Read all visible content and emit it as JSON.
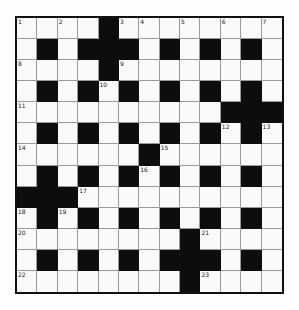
{
  "puzzle": {
    "rows": 13,
    "cols": 13,
    "grid": [
      "....#........",
      ".#.###.#.#.#.",
      "....#........",
      ".#.#.#.#.#.#.",
      "..........###",
      ".#.#.#.#.#.#.",
      "......#......",
      ".#.#.#.#.#.#.",
      "###..........",
      ".#.#.#.#.#.#.",
      "........#....",
      ".#.#.#.###.#.",
      "........#...."
    ],
    "numbers": [
      {
        "r": 0,
        "c": 0,
        "n": "1"
      },
      {
        "r": 0,
        "c": 2,
        "n": "2"
      },
      {
        "r": 0,
        "c": 5,
        "n": "3"
      },
      {
        "r": 0,
        "c": 6,
        "n": "4"
      },
      {
        "r": 0,
        "c": 8,
        "n": "5"
      },
      {
        "r": 0,
        "c": 10,
        "n": "6"
      },
      {
        "r": 0,
        "c": 12,
        "n": "7"
      },
      {
        "r": 2,
        "c": 0,
        "n": "8"
      },
      {
        "r": 2,
        "c": 5,
        "n": "9"
      },
      {
        "r": 3,
        "c": 4,
        "n": "10"
      },
      {
        "r": 4,
        "c": 0,
        "n": "11"
      },
      {
        "r": 5,
        "c": 10,
        "n": "12"
      },
      {
        "r": 5,
        "c": 12,
        "n": "13"
      },
      {
        "r": 6,
        "c": 0,
        "n": "14"
      },
      {
        "r": 6,
        "c": 7,
        "n": "15"
      },
      {
        "r": 7,
        "c": 6,
        "n": "16"
      },
      {
        "r": 8,
        "c": 3,
        "n": "17"
      },
      {
        "r": 9,
        "c": 0,
        "n": "18"
      },
      {
        "r": 9,
        "c": 2,
        "n": "19"
      },
      {
        "r": 10,
        "c": 0,
        "n": "20"
      },
      {
        "r": 10,
        "c": 9,
        "n": "21"
      },
      {
        "r": 12,
        "c": 0,
        "n": "22"
      },
      {
        "r": 12,
        "c": 9,
        "n": "23"
      }
    ],
    "colors": {
      "block": "#0d0d0d",
      "cell": "#fafafa",
      "gridline": "#9a9a9a",
      "border": "#111111"
    }
  }
}
